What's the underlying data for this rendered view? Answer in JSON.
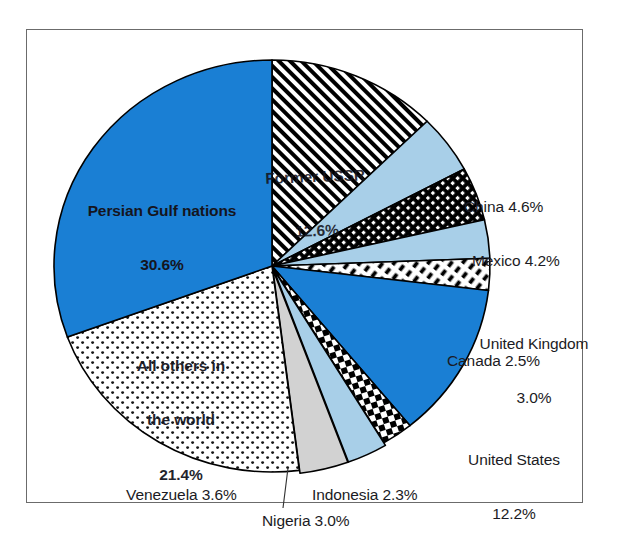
{
  "figure": {
    "name": "world-oil-reserves-pie-chart",
    "frame_border_color": "#6b6b6b",
    "background_color": "#ffffff"
  },
  "colors": {
    "blue": "#1a7fd4",
    "light_blue": "#a8cfe8",
    "gray": "#d2d2d2",
    "white": "#ffffff",
    "black": "#000000",
    "outline": "#000000",
    "text": "#1b1b24"
  },
  "chart_data": {
    "type": "pie",
    "title": "",
    "subtitle": "",
    "xlabel": "",
    "ylabel": "",
    "legend_position": "callout-labels",
    "grid": false,
    "units": "percent",
    "total": 100.0,
    "start_angle_deg": 0,
    "direction": "clockwise",
    "categories": [
      "Former USSR",
      "China",
      "Mexico",
      "United Kingdom",
      "Canada",
      "United States",
      "Indonesia",
      "Nigeria",
      "Venezuela",
      "All others in the world",
      "Persian Gulf nations"
    ],
    "values": [
      12.6,
      4.6,
      4.2,
      3.0,
      2.5,
      12.2,
      2.3,
      3.0,
      3.6,
      21.4,
      30.6
    ],
    "slices": [
      {
        "name": "Former USSR",
        "value": 12.6,
        "value_text": "12.6%",
        "label": "Former USSR",
        "label_line1": "Former USSR",
        "label_line2": "12.6%",
        "fill": "diagonal-hatch-black",
        "label_placement": "inside"
      },
      {
        "name": "China",
        "value": 4.6,
        "value_text": "4.6%",
        "label": "China 4.6%",
        "fill": "light-blue",
        "label_placement": "outside-right"
      },
      {
        "name": "Mexico",
        "value": 4.2,
        "value_text": "4.2%",
        "label": "Mexico 4.2%",
        "fill": "dense-dark-check",
        "label_placement": "outside-right"
      },
      {
        "name": "United Kingdom",
        "value": 3.0,
        "value_text": "3.0%",
        "label": "United Kingdom",
        "label_line1": "United Kingdom",
        "label_line2": "3.0%",
        "fill": "light-blue",
        "label_placement": "outside-right"
      },
      {
        "name": "Canada",
        "value": 2.5,
        "value_text": "2.5%",
        "label": "Canada 2.5%",
        "fill": "white-dash-dot",
        "label_placement": "outside-right"
      },
      {
        "name": "United States",
        "value": 12.2,
        "value_text": "12.2%",
        "label": "United States",
        "label_line1": "United States",
        "label_line2": "12.2%",
        "fill": "blue",
        "label_placement": "outside-right"
      },
      {
        "name": "Indonesia",
        "value": 2.3,
        "value_text": "2.3%",
        "label": "Indonesia 2.3%",
        "fill": "checkerboard-black",
        "label_placement": "outside-bottom"
      },
      {
        "name": "Nigeria",
        "value": 3.0,
        "value_text": "3.0%",
        "label": "Nigeria 3.0%",
        "fill": "light-blue",
        "label_placement": "outside-bottom-leader"
      },
      {
        "name": "Venezuela",
        "value": 3.6,
        "value_text": "3.6%",
        "label": "Venezuela 3.6%",
        "fill": "gray",
        "label_placement": "outside-bottom"
      },
      {
        "name": "All others in the world",
        "value": 21.4,
        "value_text": "21.4%",
        "label": "All others in the world",
        "label_line1": "All others in",
        "label_line2": "the world",
        "label_line3": "21.4%",
        "fill": "white-dotted",
        "label_placement": "inside"
      },
      {
        "name": "Persian Gulf nations",
        "value": 30.6,
        "value_text": "30.6%",
        "label": "Persian Gulf nations",
        "label_line1": "Persian Gulf nations",
        "label_line2": "30.6%",
        "fill": "blue",
        "label_placement": "inside"
      }
    ]
  },
  "labels": {
    "persian_gulf_l1": "Persian Gulf nations",
    "persian_gulf_l2": "30.6%",
    "former_ussr_l1": "Former USSR",
    "former_ussr_l2": "12.6%",
    "all_others_l1": "All others in",
    "all_others_l2": "the world",
    "all_others_l3": "21.4%",
    "china": "China 4.6%",
    "mexico": "Mexico 4.2%",
    "uk_l1": "United Kingdom",
    "uk_l2": "3.0%",
    "canada": "Canada 2.5%",
    "us_l1": "United States",
    "us_l2": "12.2%",
    "indonesia": "Indonesia 2.3%",
    "nigeria": "Nigeria 3.0%",
    "venezuela": "Venezuela 3.6%"
  }
}
